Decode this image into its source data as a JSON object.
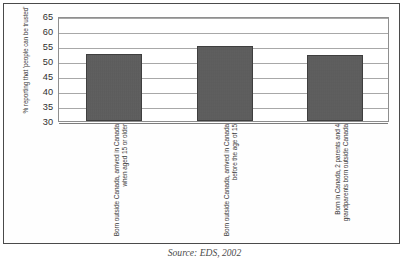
{
  "chart_data": {
    "type": "bar",
    "title": "",
    "xlabel": "",
    "ylabel": "% reporting that 'people can be trusted'",
    "ylim": [
      30,
      65
    ],
    "yticks": [
      30,
      35,
      40,
      45,
      50,
      55,
      60,
      65
    ],
    "grid": true,
    "legend": false,
    "categories": [
      "Born outside Canada, arrived in Canada when aged 15 or older",
      "Born outside Canada, arrived in Canada before the age of 15",
      "Born in Canada, 2 parents and 4 grandparents born outside Canada"
    ],
    "values": [
      52.5,
      55.0,
      52.0
    ],
    "bar_color": "#5a5a5a",
    "annotations": []
  },
  "caption": {
    "source": "Source: EDS, 2002"
  }
}
